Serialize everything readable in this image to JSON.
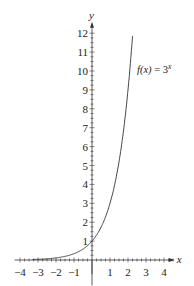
{
  "chart_data": {
    "type": "line",
    "title": "",
    "xlabel": "x",
    "ylabel": "y",
    "xlim": [
      -4.3,
      4.6
    ],
    "ylim": [
      -0.6,
      12.6
    ],
    "grid": false,
    "x_ticks": [
      -4,
      -3,
      -2,
      -1,
      1,
      2,
      3,
      4
    ],
    "y_ticks": [
      1,
      2,
      3,
      4,
      5,
      6,
      7,
      8,
      9,
      10,
      11,
      12
    ],
    "x_tick_labels": [
      "−4",
      "−3",
      "−2",
      "−1",
      "1",
      "2",
      "3",
      "4"
    ],
    "y_tick_labels": [
      "1",
      "2",
      "3",
      "4",
      "5",
      "6",
      "7",
      "8",
      "9",
      "10",
      "11",
      "12"
    ],
    "minor_ticks_per_unit": 4,
    "series": [
      {
        "name": "f(x) = 3^x",
        "function": "3^x",
        "x": [
          -3,
          -2.5,
          -2,
          -1.5,
          -1,
          -0.5,
          0,
          0.5,
          1,
          1.5,
          2,
          2.26
        ],
        "y": [
          0.037,
          0.064,
          0.111,
          0.192,
          0.333,
          0.577,
          1,
          1.732,
          3,
          5.196,
          9,
          12
        ]
      }
    ],
    "annotations": [
      {
        "text_func": "f(x)",
        "text_eq": " = 3",
        "text_exp": "x",
        "x": 2.6,
        "y": 10
      }
    ]
  }
}
